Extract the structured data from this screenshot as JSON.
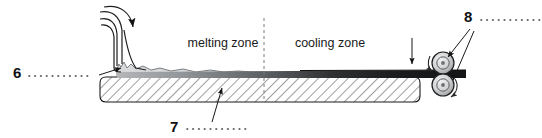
{
  "figure": {
    "width": 542,
    "height": 138,
    "background": "#ffffff"
  },
  "zones": [
    {
      "id": "melting",
      "label": "melting zone",
      "x": 223,
      "y": 47
    },
    {
      "id": "cooling",
      "label": "cooling zone",
      "x": 330,
      "y": 47
    }
  ],
  "divider": {
    "name": "zone-divider",
    "style": "dashed",
    "x": 264,
    "y_top": 18,
    "y_bottom": 100,
    "color": "#7a7a7a"
  },
  "callouts": [
    {
      "id": "6",
      "number": "6",
      "label_x": 13,
      "label_y": 78,
      "dots_x1": 28,
      "dots_x2": 92,
      "dots_y": 76,
      "leader": "from dotted leader up-right to arrow at melt inlet",
      "target": "melt-inlet",
      "arrow_x": 124,
      "arrow_y": 68
    },
    {
      "id": "7",
      "number": "7",
      "label_x": 170,
      "label_y": 131,
      "dots_x1": 186,
      "dots_x2": 248,
      "dots_y": 129,
      "leader": "from dotted leader up to arrow in hatched conveyor block",
      "target": "conveyor-block",
      "arrow_x": 220,
      "arrow_y": 84
    },
    {
      "id": "8",
      "number": "8",
      "label_x": 464,
      "label_y": 22,
      "dots_x1": 481,
      "dots_x2": 540,
      "dots_y": 20,
      "leader": "two arrows to upper and lower rollers",
      "target": "roller-pair",
      "arrow_upper_x": 445,
      "arrow_upper_y": 56,
      "arrow_lower_x": 450,
      "arrow_lower_y": 82
    }
  ],
  "parts": {
    "conveyor_block": {
      "name": "hatched conveyor block",
      "x": 100,
      "y": 77,
      "width": 320,
      "height": 25,
      "hatch": "diagonal 45deg",
      "stroke": "#1a1a1a"
    },
    "melt_layer": {
      "name": "molten material layer",
      "fill": "#d7d9da",
      "surface": "irregular wavy top flattening toward right"
    },
    "cast_sheet": {
      "name": "solidifying cast sheet",
      "x_start": 120,
      "x_end": 466,
      "fill_left": "#a9abad",
      "fill_right": "#171717",
      "note": "darkens from left to right as it cools"
    },
    "inlet": {
      "name": "melt inlet nozzle",
      "flow_lines": 3,
      "arrow": "curved arrow pointing down into melt pool"
    },
    "rollers": [
      {
        "id": "upper-roller",
        "cx": 443,
        "cy": 63,
        "r": 11,
        "rotation": "counter-clockwise",
        "fill": "#d0d2d3"
      },
      {
        "id": "lower-roller",
        "cx": 443,
        "cy": 85,
        "r": 11,
        "rotation": "counter-clockwise",
        "fill": "#d0d2d3"
      }
    ],
    "end_marker": {
      "name": "vertical end line with down arrow",
      "x": 412,
      "y_top": 38,
      "y_bottom": 72
    }
  },
  "colors": {
    "ink": "#1a1a1a",
    "melt_gray": "#d7d9da",
    "sheet_dark": "#171717",
    "roller_gray": "#d0d2d3",
    "dash_gray": "#7a7a7a"
  }
}
